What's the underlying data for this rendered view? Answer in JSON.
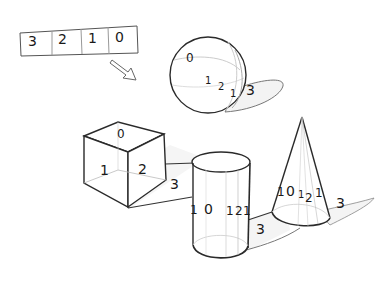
{
  "legend": {
    "cells": [
      "3",
      "2",
      "1",
      "0"
    ]
  },
  "sphere": {
    "highlight": "0",
    "halftone": "1",
    "core_shadow": "2",
    "reflected": "1",
    "cast_shadow": "3"
  },
  "cube": {
    "top": "0",
    "left": "1",
    "right": "2",
    "cast_shadow": "3"
  },
  "cylinder": {
    "edge": "1",
    "highlight": "0",
    "halftone": "1",
    "core_shadow": "2",
    "reflected": "1",
    "cast_shadow": "3"
  },
  "cone": {
    "edge": "1",
    "highlight": "0",
    "halftone": "1",
    "core_shadow": "2",
    "reflected": "1",
    "cast_shadow": "3"
  },
  "colors": {
    "line": "#2a2a2a",
    "light_line": "#b8b8b8",
    "shadow": "#f2f2f2"
  }
}
